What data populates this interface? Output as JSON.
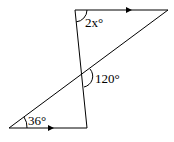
{
  "diagram": {
    "type": "geometry",
    "labels": {
      "top_angle": "2x°",
      "middle_angle": "120°",
      "bottom_angle": "36°"
    },
    "points": {
      "top_left": [
        75,
        10
      ],
      "top_right": [
        168,
        10
      ],
      "bottom_left": [
        9,
        128
      ],
      "bottom_right": [
        87,
        128
      ]
    },
    "stroke_color": "#000000"
  }
}
